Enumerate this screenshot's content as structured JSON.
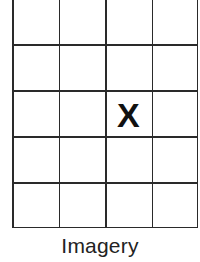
{
  "diagram": {
    "type": "grid",
    "columns": 4,
    "rows": 5,
    "top_cropped": true,
    "line_color": "#2a2a2a",
    "marks": [
      {
        "label": "X",
        "row": 3,
        "column": 3
      }
    ]
  },
  "caption": "Imagery"
}
